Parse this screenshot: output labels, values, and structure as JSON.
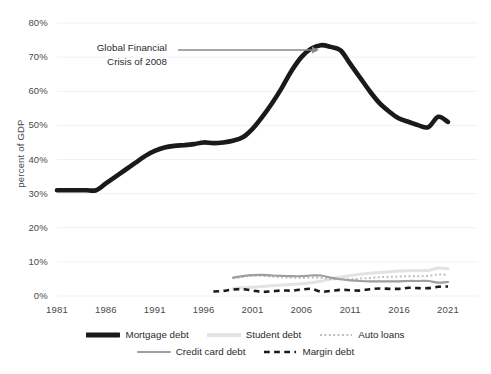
{
  "chart_data": {
    "type": "line",
    "title": "",
    "xlabel": "",
    "ylabel": "percent of GDP",
    "xlim": [
      1981,
      2021
    ],
    "ylim": [
      0,
      80
    ],
    "grid": true,
    "legend_position": "bottom",
    "y_ticks": [
      "0%",
      "10%",
      "20%",
      "30%",
      "40%",
      "50%",
      "60%",
      "70%",
      "80%"
    ],
    "y_tick_values": [
      0,
      10,
      20,
      30,
      40,
      50,
      60,
      70,
      80
    ],
    "x_ticks": [
      "1981",
      "1986",
      "1991",
      "1996",
      "2001",
      "2006",
      "2011",
      "2016",
      "2021"
    ],
    "x_tick_values": [
      1981,
      1986,
      1991,
      1996,
      2001,
      2006,
      2011,
      2016,
      2021
    ],
    "annotations": [
      {
        "text_line_1": "Global Financial",
        "text_line_2": "Crisis of 2008",
        "points_to_year": 2008,
        "points_to_value": 73
      }
    ],
    "series": [
      {
        "name": "Mortgage debt",
        "style": "solid",
        "color": "#1a1a1a",
        "width": 4.6,
        "x": [
          1981,
          1982,
          1983,
          1984,
          1985,
          1986,
          1987,
          1988,
          1989,
          1990,
          1991,
          1992,
          1993,
          1994,
          1995,
          1996,
          1997,
          1998,
          1999,
          2000,
          2001,
          2002,
          2003,
          2004,
          2005,
          2006,
          2007,
          2008,
          2009,
          2010,
          2011,
          2012,
          2013,
          2014,
          2015,
          2016,
          2017,
          2018,
          2019,
          2020,
          2021
        ],
        "values": [
          31,
          31,
          31,
          31,
          31,
          33,
          35,
          37,
          39,
          41,
          42.5,
          43.5,
          44,
          44.2,
          44.5,
          45,
          44.8,
          45,
          45.5,
          46.5,
          49,
          52.5,
          56.5,
          61,
          66,
          70,
          72.5,
          73.5,
          73,
          72,
          68,
          64,
          60,
          56.5,
          54,
          52,
          51,
          50,
          49.5,
          52.5,
          51
        ]
      },
      {
        "name": "Student debt",
        "style": "solid",
        "color": "#e3e3e3",
        "width": 3.0,
        "x": [
          1999,
          2000,
          2001,
          2002,
          2003,
          2004,
          2005,
          2006,
          2007,
          2008,
          2009,
          2010,
          2011,
          2012,
          2013,
          2014,
          2015,
          2016,
          2017,
          2018,
          2019,
          2020,
          2021
        ],
        "values": [
          2.2,
          2.4,
          2.6,
          2.8,
          3.0,
          3.2,
          3.4,
          3.6,
          3.9,
          4.3,
          5.0,
          5.5,
          6.0,
          6.4,
          6.7,
          6.9,
          7.1,
          7.3,
          7.4,
          7.5,
          7.5,
          8.2,
          8.0
        ]
      },
      {
        "name": "Auto loans",
        "style": "dotted",
        "color": "#bdbdbd",
        "width": 2.0,
        "x": [
          1999,
          2000,
          2001,
          2002,
          2003,
          2004,
          2005,
          2006,
          2007,
          2008,
          2009,
          2010,
          2011,
          2012,
          2013,
          2014,
          2015,
          2016,
          2017,
          2018,
          2019,
          2020,
          2021
        ],
        "values": [
          5.2,
          5.6,
          6.0,
          5.9,
          5.7,
          5.5,
          5.4,
          5.3,
          5.4,
          5.3,
          5.0,
          4.9,
          4.9,
          5.1,
          5.3,
          5.5,
          5.6,
          5.7,
          5.8,
          5.8,
          5.9,
          6.3,
          6.2
        ]
      },
      {
        "name": "Credit card debt",
        "style": "solid",
        "color": "#9e9e9e",
        "width": 2.2,
        "x": [
          1999,
          2000,
          2001,
          2002,
          2003,
          2004,
          2005,
          2006,
          2007,
          2008,
          2009,
          2010,
          2011,
          2012,
          2013,
          2014,
          2015,
          2016,
          2017,
          2018,
          2019,
          2020,
          2021
        ],
        "values": [
          5.4,
          5.8,
          6.1,
          6.2,
          6.0,
          5.9,
          5.8,
          5.8,
          6.0,
          6.0,
          5.4,
          4.9,
          4.6,
          4.4,
          4.3,
          4.3,
          4.3,
          4.3,
          4.4,
          4.4,
          4.4,
          3.9,
          4.1
        ]
      },
      {
        "name": "Margin debt",
        "style": "dashed",
        "color": "#1a1a1a",
        "width": 2.6,
        "x": [
          1997,
          1998,
          1999,
          2000,
          2001,
          2002,
          2003,
          2004,
          2005,
          2006,
          2007,
          2008,
          2009,
          2010,
          2011,
          2012,
          2013,
          2014,
          2015,
          2016,
          2017,
          2018,
          2019,
          2020,
          2021
        ],
        "values": [
          1.3,
          1.5,
          1.9,
          2.0,
          1.6,
          1.2,
          1.4,
          1.6,
          1.6,
          1.9,
          2.1,
          1.3,
          1.5,
          1.8,
          1.7,
          1.6,
          2.0,
          2.2,
          2.1,
          2.1,
          2.4,
          2.3,
          2.3,
          2.7,
          2.8
        ]
      }
    ]
  },
  "legend": {
    "rows": [
      [
        {
          "label": "Mortgage debt",
          "style": "solid",
          "color": "#1a1a1a",
          "width": 5
        },
        {
          "label": "Student debt",
          "style": "solid",
          "color": "#e3e3e3",
          "width": 4
        },
        {
          "label": "Auto loans",
          "style": "dotted",
          "color": "#bdbdbd",
          "width": 2
        }
      ],
      [
        {
          "label": "Credit card debt",
          "style": "solid",
          "color": "#9e9e9e",
          "width": 2
        },
        {
          "label": "Margin debt",
          "style": "dashed",
          "color": "#1a1a1a",
          "width": 2.6
        }
      ]
    ]
  }
}
